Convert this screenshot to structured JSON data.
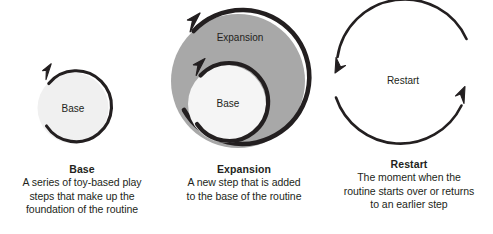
{
  "figure": {
    "background_color": "#ffffff",
    "ink_color": "#231f20",
    "light_fill_color": "#f0f0f0",
    "gray_fill_color": "#a8a8a8"
  },
  "panels": [
    {
      "id": "base",
      "diagram_label": "Base",
      "caption_title": "Base",
      "caption_lines": [
        "A series of toy-based play",
        "steps that make up the",
        "foundation of the routine"
      ],
      "shape": "single light circle with one clockwise loop arrow"
    },
    {
      "id": "expansion",
      "diagram_outer_label": "Expansion",
      "diagram_inner_label": "Base",
      "caption_title": "Expansion",
      "caption_lines": [
        "A new step that is added",
        "to the base of the routine"
      ],
      "shape": "large gray circle with loop arrow enclosing a smaller light circle with its own loop arrow"
    },
    {
      "id": "restart",
      "diagram_label": "Restart",
      "caption_title": "Restart",
      "caption_lines": [
        "The moment when the",
        "routine starts over or returns",
        "to an earlier step"
      ],
      "shape": "two opposing semicircular arrows forming a refresh cycle"
    }
  ]
}
